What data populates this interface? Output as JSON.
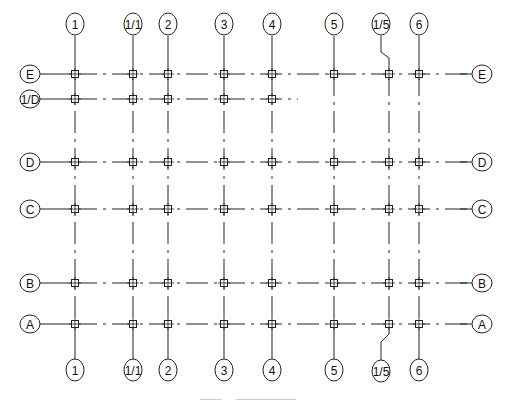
{
  "vertical_axes": [
    {
      "label": "1",
      "x": 75
    },
    {
      "label": "1/1",
      "x": 133
    },
    {
      "label": "2",
      "x": 168
    },
    {
      "label": "3",
      "x": 224
    },
    {
      "label": "4",
      "x": 272
    },
    {
      "label": "5",
      "x": 334
    },
    {
      "label": "1/5",
      "x": 389
    },
    {
      "label": "6",
      "x": 419
    }
  ],
  "horizontal_axes": [
    {
      "label": "E",
      "y": 74
    },
    {
      "label": "1/D",
      "y": 99
    },
    {
      "label": "D",
      "y": 162
    },
    {
      "label": "C",
      "y": 209
    },
    {
      "label": "B",
      "y": 283
    },
    {
      "label": "A",
      "y": 324
    }
  ],
  "caption": {
    "visible": true,
    "legible": false
  },
  "colors": {
    "line": "#222222",
    "background": "#ffffff"
  }
}
